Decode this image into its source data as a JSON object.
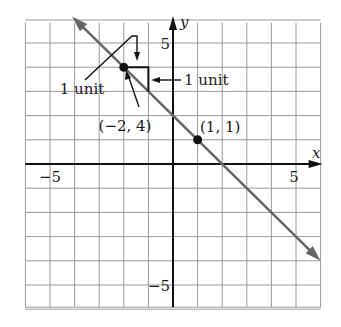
{
  "chart_data": {
    "type": "line",
    "title": "",
    "xlabel": "x",
    "ylabel": "y",
    "xlim": [
      -6,
      6
    ],
    "ylim": [
      -6,
      6
    ],
    "grid": true,
    "x_ticks": [
      {
        "value": -5,
        "label": "−5"
      },
      {
        "value": 5,
        "label": "5"
      }
    ],
    "y_ticks": [
      {
        "value": 5,
        "label": "5"
      },
      {
        "value": -5,
        "label": "−5"
      }
    ],
    "line": {
      "equation": "y = -x + 2",
      "slope": -1,
      "intercept": 2,
      "from": [
        -4.1,
        6.1
      ],
      "to": [
        6,
        -4
      ],
      "color": "#666666",
      "arrows": "both"
    },
    "points": [
      {
        "x": -2,
        "y": 4,
        "label": "(−2, 4)"
      },
      {
        "x": 1,
        "y": 1,
        "label": "(1, 1)"
      }
    ],
    "annotations": [
      {
        "text": "1 unit",
        "refers_to": "vertical drop of slope triangle"
      },
      {
        "text": "1 unit",
        "refers_to": "horizontal run of slope triangle"
      }
    ],
    "slope_triangle": {
      "corner_from": [
        -2,
        4
      ],
      "corner_right": [
        -1,
        4
      ],
      "corner_down": [
        -1,
        3
      ]
    }
  }
}
